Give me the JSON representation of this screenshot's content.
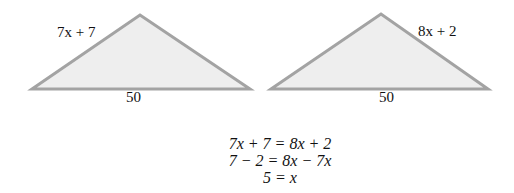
{
  "triangles": [
    {
      "side_label": "7x + 7",
      "base_label": "50",
      "points": "32,89 140,15 250,89"
    },
    {
      "side_label": "8x + 2",
      "base_label": "50",
      "points": "271,89 381,14 488,89"
    }
  ],
  "equations": [
    "7x + 7 = 8x + 2",
    "7 − 2 = 8x − 7x",
    "5 = x"
  ],
  "colors": {
    "fill": "#eeeeee",
    "stroke": "#a3a3a3"
  }
}
